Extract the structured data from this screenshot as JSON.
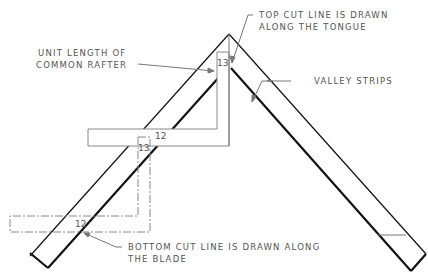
{
  "diagram": {
    "labels": {
      "unit_length_1": "UNIT LENGTH OF",
      "unit_length_2": "COMMON RAFTER",
      "top_cut_1": "TOP CUT LINE IS DRAWN",
      "top_cut_2": "ALONG THE TONGUE",
      "valley": "VALLEY STRIPS",
      "bottom_cut_1": "BOTTOM CUT LINE IS DRAWN ALONG",
      "bottom_cut_2": "THE BLADE"
    },
    "numbers": {
      "top_tongue": "13",
      "top_blade": "12",
      "dashed_tongue": "13",
      "dashed_blade": "12"
    },
    "colors": {
      "line": "#111111",
      "leader": "#777777",
      "text": "#555555"
    }
  }
}
